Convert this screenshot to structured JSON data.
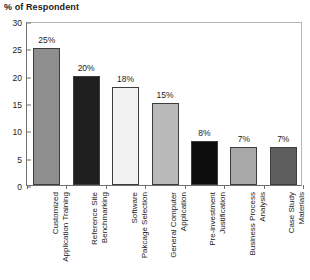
{
  "chart_data": {
    "type": "bar",
    "title": "% of Respondent",
    "xlabel": "",
    "ylabel": "",
    "ylim": [
      0,
      30
    ],
    "ytick_step": 5,
    "yticks": [
      "0",
      "5",
      "10",
      "15",
      "20",
      "25",
      "30"
    ],
    "grid": false,
    "legend": "none",
    "categories": [
      "Customized Application Training",
      "Reference Site Benchmarking",
      "Software Pakcage Selection",
      "General Computer Application",
      "Pre-investment Justification",
      "Business Process Analysis",
      "Case Study Materials"
    ],
    "category_lines": [
      [
        "Customized",
        "Application Training"
      ],
      [
        "Reference Site",
        "Benchmarking"
      ],
      [
        "Software",
        "Pakcage Selection"
      ],
      [
        "General Computer",
        "Application"
      ],
      [
        "Pre-investment",
        "Justification"
      ],
      [
        "Business Process",
        "Analysis"
      ],
      [
        "Case Study",
        "Materials"
      ]
    ],
    "values": [
      25,
      20,
      18,
      15,
      8,
      7,
      7
    ],
    "value_labels": [
      "25%",
      "20%",
      "18%",
      "15%",
      "8%",
      "7%",
      "7%"
    ],
    "bar_colors": [
      "#8f8f8f",
      "#1f1f1f",
      "#f2f2f2",
      "#b9b9b9",
      "#0d0d0d",
      "#a8a8a8",
      "#5e5e5e"
    ],
    "bar_border_color": "#3d3d3d",
    "axis_color": "#6f6f6f",
    "frame_color": "#b6b6b6",
    "text_color": "#1b1b1b",
    "background": "#ffffff"
  }
}
